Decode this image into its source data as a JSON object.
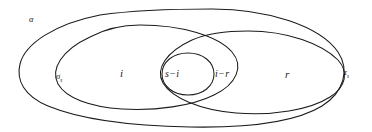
{
  "figure": {
    "type": "venn-diagram",
    "background_color": "#ffffff",
    "stroke_color": "#1a1a1a",
    "width": 372,
    "height": 132
  },
  "labels": {
    "outer_set": "α",
    "left_set_base": "σ",
    "left_set_subscript": "s",
    "right_set_base": "τ",
    "right_set_subscript": "s",
    "region_i": "i",
    "region_s_minus_i": "s−i",
    "region_i_minus_r": "i−r",
    "region_r": "r"
  },
  "shapes": [
    {
      "name": "outer-ellipse-alpha",
      "label": "α",
      "role": "outermost enclosing region"
    },
    {
      "name": "left-ellipse-sigma",
      "label": "σs",
      "role": "left inner ellipse containing i and s-i"
    },
    {
      "name": "right-ellipse-tau",
      "label": "τs",
      "role": "right ellipse containing s-i, i-r and r"
    },
    {
      "name": "center-small-ellipse",
      "label": "s−i",
      "role": "intersection lens of left and right ellipses"
    }
  ]
}
